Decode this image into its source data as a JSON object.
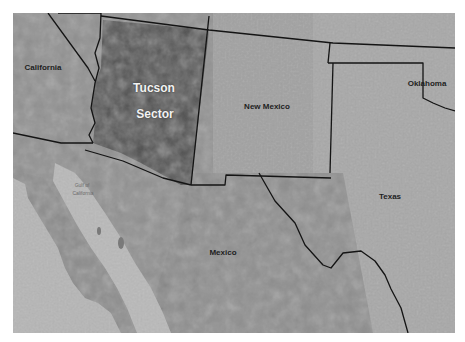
{
  "map": {
    "type": "shaded-relief region map",
    "palette": {
      "land_base": "#9a9a9a",
      "land_light": "#b4b4b4",
      "mountain_dark": "#6e6e6e",
      "water": "#b8b8b8",
      "sector_fill": "#3a3a3a",
      "border": "#141414",
      "sector_label": "#f2f2f2",
      "region_label": "#1e1e1e"
    },
    "highlight": {
      "name": "Tucson Sector",
      "line1": "Tucson",
      "line2": "Sector"
    },
    "labels": {
      "california": "California",
      "new_mexico": "New Mexico",
      "oklahoma": "Oklahoma",
      "texas": "Texas",
      "mexico": "Mexico",
      "gulf_line1": "Gulf of",
      "gulf_line2": "California"
    }
  }
}
